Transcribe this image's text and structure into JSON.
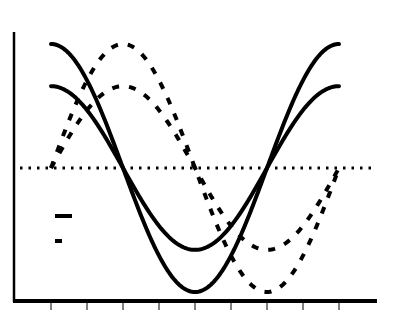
{
  "chart_data": {
    "type": "line",
    "title": "",
    "xlabel": "",
    "ylabel": "",
    "grid": false,
    "x_ticks": 9,
    "x_tick_labels": [],
    "y_tick_labels": [],
    "xlim": [
      0,
      360
    ],
    "ylim": [
      -1.2,
      1.2
    ],
    "reference_line": {
      "y": 0,
      "style": "dotted"
    },
    "legend": {
      "position": "left-middle",
      "entries": [
        {
          "label": "",
          "style": "solid"
        },
        {
          "label": "",
          "style": "dashed"
        }
      ]
    },
    "x": [
      0,
      45,
      90,
      135,
      180,
      225,
      270,
      315,
      360
    ],
    "series": [
      {
        "name": "cosine (large amplitude)",
        "style": "solid",
        "amplitude": 1.0,
        "values": [
          1.0,
          0.71,
          0.0,
          -0.71,
          -1.0,
          -0.71,
          0.0,
          0.71,
          1.0
        ]
      },
      {
        "name": "cosine (small amplitude)",
        "style": "solid",
        "amplitude": 0.66,
        "values": [
          0.66,
          0.47,
          0.0,
          -0.47,
          -0.66,
          -0.47,
          0.0,
          0.47,
          0.66
        ]
      },
      {
        "name": "sine (large amplitude)",
        "style": "dashed",
        "amplitude": 1.0,
        "values": [
          0.0,
          0.71,
          1.0,
          0.71,
          0.0,
          -0.71,
          -1.0,
          -0.71,
          0.0
        ]
      },
      {
        "name": "sine (small amplitude)",
        "style": "dashed",
        "amplitude": 0.66,
        "values": [
          0.0,
          0.47,
          0.66,
          0.47,
          0.0,
          -0.47,
          -0.66,
          -0.47,
          0.0
        ]
      }
    ]
  },
  "colors": {
    "line": "#000000",
    "background": "#ffffff"
  }
}
